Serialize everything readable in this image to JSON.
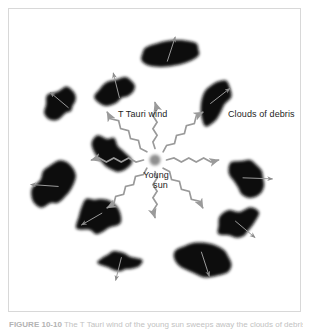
{
  "figure": {
    "caption_label": "FIGURE 10-10",
    "caption_text": "The T Tauri wind of the young sun sweeps away the clouds of debris.",
    "background_color": "#ffffff",
    "frame_color": "#d8d8d8"
  },
  "labels": {
    "t_tauri_wind": "T Tauri wind",
    "clouds_of_debris": "Clouds of debris",
    "young_sun_line1": "Young",
    "young_sun_line2": "sun"
  },
  "colors": {
    "blob_fill": "#111111",
    "sun_fill": "#8e8e8e",
    "wind_arrow": "#9a9a9a",
    "blob_arrow": "#9a9a9a",
    "text": "#1d1d1d",
    "caption_text": "#bbbbbb"
  },
  "sun": {
    "name": "young-sun",
    "cx": 147,
    "cy": 152,
    "r": 5.5,
    "fill": "#8e8e8e"
  },
  "wind_arrows": [
    {
      "name": "wind-arrow-n",
      "angle": -90,
      "length": 46
    },
    {
      "name": "wind-arrow-ne",
      "angle": -45,
      "length": 56
    },
    {
      "name": "wind-arrow-e",
      "angle": 0,
      "length": 52
    },
    {
      "name": "wind-arrow-se",
      "angle": 45,
      "length": 56
    },
    {
      "name": "wind-arrow-s",
      "angle": 90,
      "length": 46
    },
    {
      "name": "wind-arrow-sw",
      "angle": 135,
      "length": 56
    },
    {
      "name": "wind-arrow-w",
      "angle": 180,
      "length": 52
    },
    {
      "name": "wind-arrow-nw",
      "angle": -135,
      "length": 56
    }
  ],
  "debris_blobs": [
    {
      "name": "debris-blob-top",
      "cx": 162,
      "cy": 45,
      "rx": 30,
      "ry": 13,
      "rot": -8,
      "shape": "ellipse",
      "arrow_angle": -72,
      "arrow_len": 26
    },
    {
      "name": "debris-blob-upper-left",
      "cx": 56,
      "cy": 96,
      "rx": 20,
      "ry": 15,
      "rot": -35,
      "shape": "kidney",
      "arrow_angle": -140,
      "arrow_len": 24
    },
    {
      "name": "debris-blob-upper-mid",
      "cx": 110,
      "cy": 84,
      "rx": 21,
      "ry": 14,
      "rot": -20,
      "shape": "kidney",
      "arrow_angle": -104,
      "arrow_len": 26
    },
    {
      "name": "debris-blob-upper-right",
      "cx": 207,
      "cy": 92,
      "rx": 15,
      "ry": 20,
      "rot": 25,
      "shape": "blob",
      "arrow_angle": -38,
      "arrow_len": 25
    },
    {
      "name": "debris-blob-left",
      "cx": 44,
      "cy": 178,
      "rx": 17,
      "ry": 22,
      "rot": 10,
      "shape": "blob",
      "arrow_angle": 184,
      "arrow_len": 28
    },
    {
      "name": "debris-blob-left-lower",
      "cx": 89,
      "cy": 208,
      "rx": 17,
      "ry": 20,
      "rot": -15,
      "shape": "blob",
      "arrow_angle": 150,
      "arrow_len": 24
    },
    {
      "name": "debris-blob-right-upper",
      "cx": 240,
      "cy": 170,
      "rx": 18,
      "ry": 18,
      "rot": 0,
      "shape": "blob",
      "arrow_angle": 2,
      "arrow_len": 30
    },
    {
      "name": "debris-blob-right-lower",
      "cx": 232,
      "cy": 217,
      "rx": 21,
      "ry": 16,
      "rot": -12,
      "shape": "kidney",
      "arrow_angle": 40,
      "arrow_len": 26
    },
    {
      "name": "debris-blob-bottom-mid",
      "cx": 112,
      "cy": 255,
      "rx": 20,
      "ry": 11,
      "rot": 8,
      "shape": "kidney",
      "arrow_angle": 104,
      "arrow_len": 24
    },
    {
      "name": "debris-blob-bottom",
      "cx": 196,
      "cy": 252,
      "rx": 29,
      "ry": 16,
      "rot": 10,
      "shape": "ellipse",
      "arrow_angle": 72,
      "arrow_len": 26
    },
    {
      "name": "debris-blob-lower-left",
      "cx": 103,
      "cy": 147,
      "rx": 15,
      "ry": 19,
      "rot": -18,
      "shape": "blob",
      "arrow_angle": 196,
      "arrow_len": 0
    }
  ]
}
